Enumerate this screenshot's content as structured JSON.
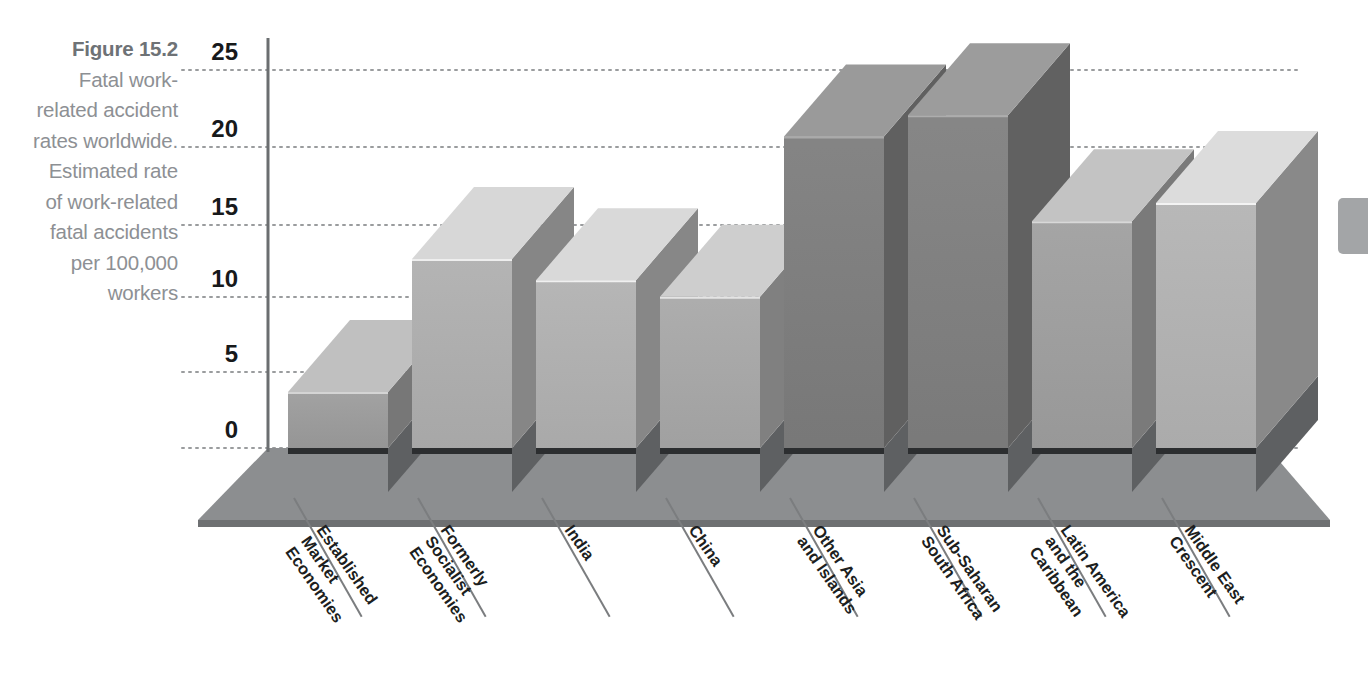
{
  "caption": {
    "figure_word": "Figure",
    "figure_number": "15.2",
    "text": "Fatal work-related accident rates worldwide. Estimated rate of work-related fatal accidents per 100,000 workers",
    "full": "Figure 15.2 Fatal work-related accident rates worldwide. Estimated rate of work-related fatal accidents per 100,000 workers"
  },
  "chart_data": {
    "type": "bar",
    "title": "Fatal work-related accident rates worldwide",
    "subtitle": "Estimated rate of work-related fatal accidents per 100,000 workers",
    "xlabel": "",
    "ylabel": "Estimated rate of work-related fatal accidents per 100,000 workers",
    "ylim": [
      0,
      25
    ],
    "yticks": [
      0,
      5,
      10,
      15,
      20,
      25
    ],
    "ytick_labels": [
      "0",
      "5",
      "10",
      "15",
      "20",
      "25"
    ],
    "grid": true,
    "grid_style": "dotted",
    "legend": "none",
    "projection": "3d-isometric",
    "categories": [
      "Established Market Economies",
      "Formerly Socialist Economies",
      "India",
      "China",
      "Other Asia and Islands",
      "Sub-Saharan South Africa",
      "Latin America and the Caribbean",
      "Middle East Crescent"
    ],
    "category_lines": [
      [
        "Established",
        "Market",
        "Economies"
      ],
      [
        "Formerly",
        "Socialist",
        "Economies"
      ],
      [
        "India"
      ],
      [
        "China"
      ],
      [
        "Other Asia",
        "and Islands"
      ],
      [
        "Sub-Saharan",
        "South Africa"
      ],
      [
        "Latin America",
        "and the",
        "Caribbean"
      ],
      [
        "Middle East",
        "Crescent"
      ]
    ],
    "values": [
      3.7,
      12.5,
      11.1,
      10.0,
      20.6,
      22.0,
      15.0,
      16.2
    ],
    "bar_colors": [
      "#9d9d9d",
      "#b0b0b0",
      "#b2b2b2",
      "#a9a9a9",
      "#7e7e7e",
      "#808080",
      "#a0a0a0",
      "#b4b4b4"
    ]
  },
  "colors": {
    "caption_text": "#8d9094",
    "caption_figure": "#6e7276",
    "tick_text": "#17191b",
    "axis_line": "#6b6e70",
    "grid_line": "#9a9c9e",
    "floor_top": "#8c8e90",
    "floor_band": "#3c3e40",
    "page_tab": "#a3a5a7"
  },
  "page_tab": {
    "label": ""
  }
}
